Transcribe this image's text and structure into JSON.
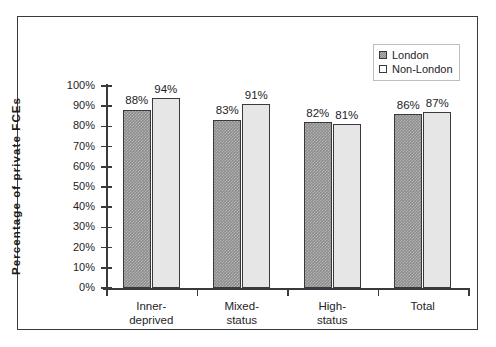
{
  "chart_data": {
    "type": "bar",
    "title": "",
    "xlabel": "",
    "ylabel": "Percentage  of  private  FCEs",
    "ylim": [
      0,
      100
    ],
    "ytick_labels": [
      "100%",
      "90%",
      "80%",
      "70%",
      "60%",
      "50%",
      "40%",
      "30%",
      "20%",
      "10%",
      "0%"
    ],
    "ytick_values": [
      100,
      90,
      80,
      70,
      60,
      50,
      40,
      30,
      20,
      10,
      0
    ],
    "grid": false,
    "legend_position": "top-right",
    "categories": [
      "Inner-deprived",
      "Mixed-status",
      "High-status",
      "Total"
    ],
    "category_lines": [
      [
        "Inner-",
        "deprived"
      ],
      [
        "Mixed-",
        "status"
      ],
      [
        "High-",
        "status"
      ],
      [
        "Total",
        ""
      ]
    ],
    "series": [
      {
        "name": "London",
        "color": "#8d8d8d",
        "values": [
          88,
          83,
          82,
          86
        ],
        "value_labels": [
          "88%",
          "83%",
          "82%",
          "86%"
        ]
      },
      {
        "name": "Non-London",
        "color": "#e6e6e6",
        "values": [
          94,
          91,
          81,
          87
        ],
        "value_labels": [
          "94%",
          "91%",
          "81%",
          "87%"
        ]
      }
    ]
  },
  "legend": {
    "entries": [
      {
        "label": "London",
        "swatch": "dark-hatched-swatch"
      },
      {
        "label": "Non-London",
        "swatch": "light-swatch"
      }
    ]
  },
  "colors": {
    "axis": "#3a3a3e",
    "frame": "#3a3a3e",
    "text": "#242428",
    "london_bar": "#8d8d8d",
    "nonlondon_bar": "#e6e6e6",
    "background": "#ffffff"
  }
}
